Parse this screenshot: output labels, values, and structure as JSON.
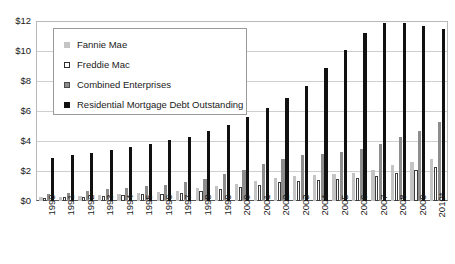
{
  "chart_data": {
    "type": "bar",
    "title": "",
    "xlabel": "",
    "ylabel": "",
    "grid": true,
    "legend_position": "upper-left-inside",
    "ylim": [
      0,
      12
    ],
    "ytick_labels": [
      "$12",
      "$10",
      "$8",
      "$6",
      "$4",
      "$2",
      "$0"
    ],
    "ytick_values": [
      12,
      10,
      8,
      6,
      4,
      2,
      0
    ],
    "categories": [
      "1990",
      "1991",
      "1992",
      "1993",
      "1994",
      "1995",
      "1996",
      "1997",
      "1998",
      "1999",
      "2000",
      "2001",
      "2002",
      "2003",
      "2004",
      "2005",
      "2006",
      "2007",
      "2008",
      "2009",
      "2010*"
    ],
    "series": [
      {
        "name": "Fannie Mae",
        "color": "#c4c4c4",
        "values": [
          0.25,
          0.3,
          0.35,
          0.42,
          0.5,
          0.55,
          0.6,
          0.7,
          0.85,
          1.0,
          1.15,
          1.35,
          1.55,
          1.7,
          1.75,
          1.8,
          1.9,
          2.1,
          2.4,
          2.6,
          2.8
        ]
      },
      {
        "name": "Freddie Mac",
        "color": "#ffffff",
        "values": [
          0.2,
          0.25,
          0.3,
          0.35,
          0.4,
          0.45,
          0.5,
          0.55,
          0.65,
          0.8,
          0.95,
          1.1,
          1.25,
          1.35,
          1.4,
          1.45,
          1.55,
          1.7,
          1.9,
          2.1,
          2.3
        ]
      },
      {
        "name": "Combined Enterprises",
        "color": "#8d8d8d",
        "values": [
          0.45,
          0.55,
          0.65,
          0.77,
          0.9,
          1.0,
          1.1,
          1.25,
          1.5,
          1.8,
          2.1,
          2.45,
          2.8,
          3.05,
          3.15,
          3.25,
          3.45,
          3.8,
          4.3,
          4.7,
          5.3
        ]
      },
      {
        "name": "Residential Mortgage Debt Outstanding",
        "color": "#111111",
        "values": [
          2.9,
          3.05,
          3.2,
          3.4,
          3.6,
          3.8,
          4.05,
          4.3,
          4.7,
          5.1,
          5.6,
          6.2,
          6.9,
          7.7,
          8.9,
          10.1,
          11.2,
          11.9,
          11.9,
          11.7,
          11.5
        ]
      }
    ]
  },
  "legend": {
    "items": [
      {
        "label": "Fannie Mae",
        "swatch": "fannie"
      },
      {
        "label": "Freddie Mac",
        "swatch": "freddie"
      },
      {
        "label": "Combined Enterprises",
        "swatch": "combined"
      },
      {
        "label": "Residential Mortgage Debt Outstanding",
        "swatch": "rmdo"
      }
    ]
  }
}
